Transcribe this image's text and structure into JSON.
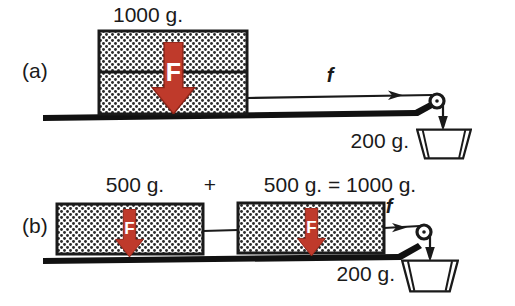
{
  "figure": {
    "panels": [
      {
        "id": "a",
        "label": "(a)",
        "block_mass_label": "1000 g.",
        "force_glyph": "F",
        "string_force_label": "f",
        "hanging_mass_label": "200 g.",
        "block_count": 1,
        "block_split": true
      },
      {
        "id": "b",
        "label": "(b)",
        "mass_left_label": "500 g.",
        "plus_label": "+",
        "mass_right_label": "500 g. = 1000 g.",
        "force_glyph": "F",
        "string_force_label": "f",
        "hanging_mass_label": "200 g.",
        "block_count": 2,
        "block_split": false
      }
    ],
    "colors": {
      "arrow_red": "#bf3a2b",
      "arrow_red_dark": "#8c2317",
      "ink": "#1a1a1a",
      "stipple": "#2b2b2b",
      "paper": "#ffffff"
    },
    "icons": {
      "force_arrow": "down-arrow-icon",
      "tension_arrow": "right-arrow-icon",
      "pulley": "pulley-icon",
      "weight_pan": "weight-pan-icon"
    }
  }
}
